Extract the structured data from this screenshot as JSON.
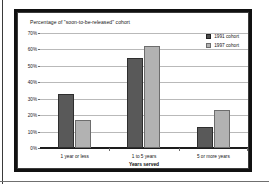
{
  "chart_data": {
    "type": "bar",
    "title": "Percentage of \"soon-to-be-released\" cohort",
    "xlabel": "Years served",
    "ylabel": "",
    "categories": [
      "1 year or less",
      "1 to 5 years",
      "5 or more years"
    ],
    "series": [
      {
        "name": "1991 cohort",
        "color": "#595959",
        "values": [
          33,
          55,
          13
        ]
      },
      {
        "name": "1997 cohort",
        "color": "#b2b2b2",
        "values": [
          17,
          62,
          23
        ]
      }
    ],
    "ylim": [
      0,
      70
    ],
    "ytick_labels": [
      "0%",
      "10%",
      "20%",
      "30%",
      "40%",
      "50%",
      "60%",
      "70%"
    ],
    "ytick_values": [
      0,
      10,
      20,
      30,
      40,
      50,
      60,
      70
    ],
    "grid": true,
    "legend_position": "top-right"
  }
}
